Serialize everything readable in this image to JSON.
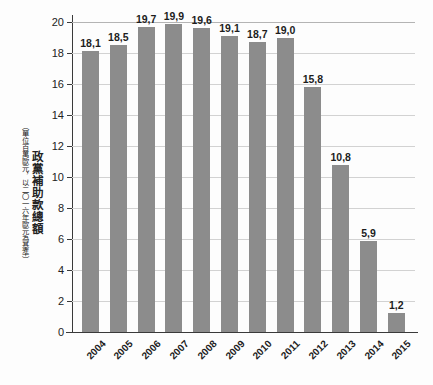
{
  "chart_data": {
    "type": "bar",
    "title": "",
    "ylabel": "政黨補助款總額",
    "ylabel_note": "（單位百萬歐元，以二〇一六年歐元為基準）",
    "xlabel": "",
    "categories": [
      "2004",
      "2005",
      "2006",
      "2007",
      "2008",
      "2009",
      "2010",
      "2011",
      "2012",
      "2013",
      "2014",
      "2015"
    ],
    "values": [
      18.1,
      18.5,
      19.7,
      19.9,
      19.6,
      19.1,
      18.7,
      19.0,
      15.8,
      10.8,
      5.9,
      1.2
    ],
    "value_labels": [
      "18,1",
      "18,5",
      "19,7",
      "19,9",
      "19,6",
      "19,1",
      "18,7",
      "19,0",
      "15,8",
      "10,8",
      "5,9",
      "1,2"
    ],
    "ylim": [
      0,
      20
    ],
    "yticks": [
      0,
      2,
      4,
      6,
      8,
      10,
      12,
      14,
      16,
      18,
      20
    ],
    "ytick_labels": [
      "0",
      "2",
      "4",
      "6",
      "8",
      "10",
      "12",
      "14",
      "16",
      "18",
      "20"
    ],
    "grid": true,
    "legend": "none",
    "bar_color": "#8c8c8c",
    "grid_color": "#d2d2d2",
    "axis_color": "#3a3a3a",
    "background_color": "#fdfdfd"
  }
}
